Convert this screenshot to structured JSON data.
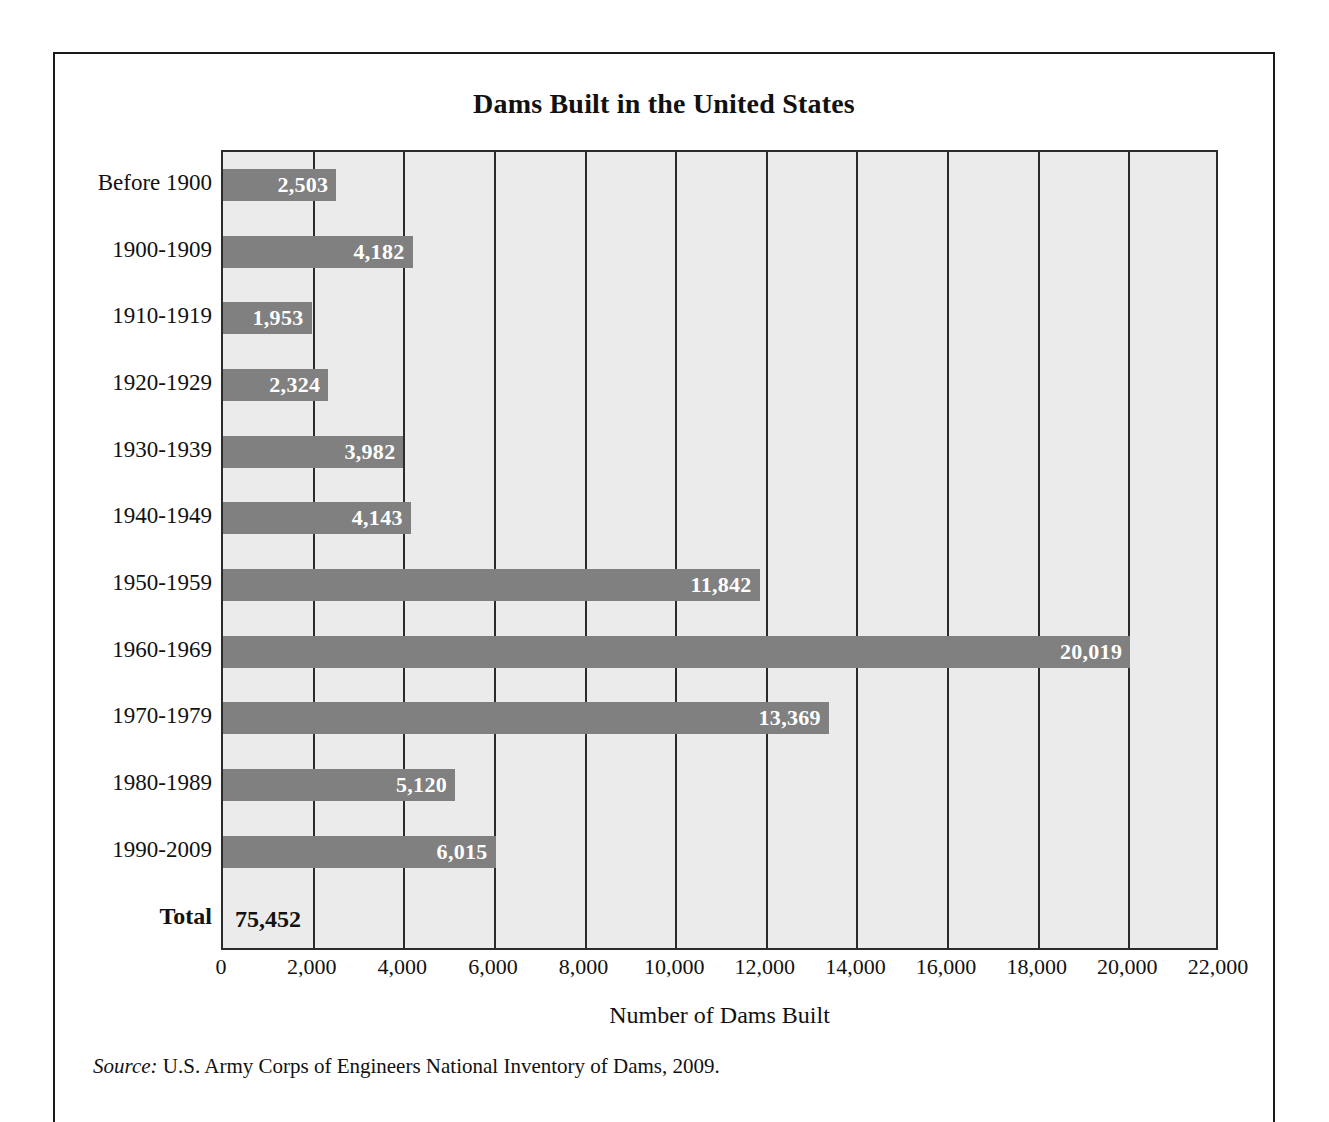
{
  "figure": {
    "title": "Dams Built in the United States",
    "source_label": "Source:",
    "source_text": " U.S. Army Corps of Engineers National Inventory of Dams, 2009.",
    "bar_color": "#808080",
    "plot_background": "#ebebeb",
    "gridline_color": "#2b2b2b",
    "frame_color": "#1a1a1a"
  },
  "chart_data": {
    "type": "bar",
    "orientation": "horizontal",
    "title": "Dams Built in the United States",
    "xlabel": "Number of Dams Built",
    "ylabel": "",
    "xlim": [
      0,
      22000
    ],
    "xticks": [
      0,
      2000,
      4000,
      6000,
      8000,
      10000,
      12000,
      14000,
      16000,
      18000,
      20000,
      22000
    ],
    "xtick_labels": [
      "0",
      "2,000",
      "4,000",
      "6,000",
      "8,000",
      "10,000",
      "12,000",
      "14,000",
      "16,000",
      "18,000",
      "20,000",
      "22,000"
    ],
    "grid": "vertical",
    "legend": "none",
    "categories": [
      "Before 1900",
      "1900-1909",
      "1910-1919",
      "1920-1929",
      "1930-1939",
      "1940-1949",
      "1950-1959",
      "1960-1969",
      "1970-1979",
      "1980-1989",
      "1990-2009",
      "Total"
    ],
    "values": [
      2503,
      4182,
      1953,
      2324,
      3982,
      4143,
      11842,
      20019,
      13369,
      5120,
      6015,
      75452
    ],
    "value_labels": [
      "2,503",
      "4,182",
      "1,953",
      "2,324",
      "3,982",
      "4,143",
      "11,842",
      "20,019",
      "13,369",
      "5,120",
      "6,015",
      "75,452"
    ],
    "bars": [
      {
        "category": "Before 1900",
        "value": 2503,
        "label": "2,503",
        "has_bar": true
      },
      {
        "category": "1900-1909",
        "value": 4182,
        "label": "4,182",
        "has_bar": true
      },
      {
        "category": "1910-1919",
        "value": 1953,
        "label": "1,953",
        "has_bar": true
      },
      {
        "category": "1920-1929",
        "value": 2324,
        "label": "2,324",
        "has_bar": true
      },
      {
        "category": "1930-1939",
        "value": 3982,
        "label": "3,982",
        "has_bar": true
      },
      {
        "category": "1940-1949",
        "value": 4143,
        "label": "4,143",
        "has_bar": true
      },
      {
        "category": "1950-1959",
        "value": 11842,
        "label": "11,842",
        "has_bar": true
      },
      {
        "category": "1960-1969",
        "value": 20019,
        "label": "20,019",
        "has_bar": true
      },
      {
        "category": "1970-1979",
        "value": 13369,
        "label": "13,369",
        "has_bar": true
      },
      {
        "category": "1980-1989",
        "value": 5120,
        "label": "5,120",
        "has_bar": true
      },
      {
        "category": "1990-2009",
        "value": 6015,
        "label": "6,015",
        "has_bar": true
      },
      {
        "category": "Total",
        "value": 75452,
        "label": "75,452",
        "has_bar": false
      }
    ]
  }
}
